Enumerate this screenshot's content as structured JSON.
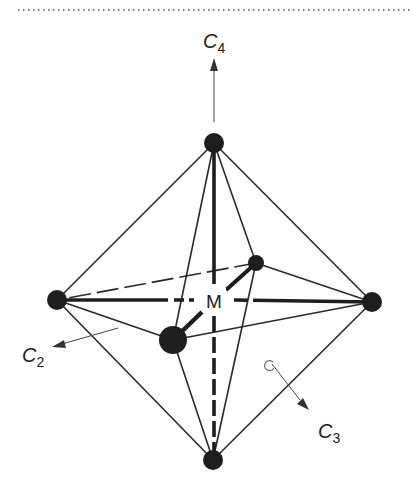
{
  "diagram": {
    "center_label": "M",
    "axes": [
      {
        "id": "C4",
        "letter": "C",
        "subscript": "4"
      },
      {
        "id": "C2",
        "letter": "C",
        "subscript": "2"
      },
      {
        "id": "C3",
        "letter": "C",
        "subscript": "3"
      }
    ],
    "colors": {
      "line": "#2a2a2a",
      "atom": "#1e1e1e",
      "arrow": "#444444",
      "dotted_rule": "#555555",
      "background": "#ffffff"
    }
  }
}
